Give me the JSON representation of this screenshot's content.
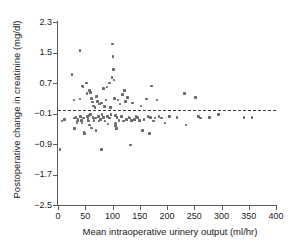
{
  "chart_data": {
    "type": "scatter",
    "title": "",
    "xlabel": "Mean intraoperative urinery output (ml/hr)",
    "ylabel": "Postoperative change in creatinine (mg/dl)",
    "xlim": [
      0,
      400
    ],
    "ylim": [
      -2.5,
      2.3
    ],
    "xticks": [
      0,
      50,
      100,
      150,
      200,
      250,
      300,
      350,
      400
    ],
    "yticks": [
      -2.5,
      -1.7,
      -0.9,
      -0.1,
      0.7,
      1.5,
      2.3
    ],
    "xtick_labels": [
      "0",
      "50",
      "100",
      "150",
      "200",
      "250",
      "300",
      "350",
      "400"
    ],
    "ytick_labels": [
      "-2.5",
      "-1.7",
      "-0.9",
      "-0.1",
      "0.7",
      "1.5",
      "2.3"
    ],
    "grid": false,
    "legend": null,
    "marker_color": "#6b6b6b",
    "reference_line": {
      "orientation": "horizontal",
      "y": 0.0,
      "style": "dashed",
      "color": "#3a3a3a"
    },
    "series": [
      {
        "name": "Patients",
        "points": [
          [
            4,
            -1.05
          ],
          [
            7,
            -0.3
          ],
          [
            12,
            -0.25
          ],
          [
            26,
            0.93
          ],
          [
            29,
            0.25
          ],
          [
            30,
            -0.5
          ],
          [
            30,
            -0.22
          ],
          [
            33,
            -0.2
          ],
          [
            35,
            -0.35
          ],
          [
            36,
            -0.3
          ],
          [
            37,
            -0.25
          ],
          [
            40,
            1.55
          ],
          [
            40,
            0.28
          ],
          [
            41,
            -0.18
          ],
          [
            42,
            -0.3
          ],
          [
            43,
            -0.28
          ],
          [
            44,
            -0.35
          ],
          [
            45,
            0.62
          ],
          [
            46,
            0.6
          ],
          [
            47,
            -0.22
          ],
          [
            48,
            -0.58
          ],
          [
            49,
            -0.62
          ],
          [
            52,
            0.7
          ],
          [
            53,
            0.42
          ],
          [
            54,
            -0.18
          ],
          [
            55,
            -0.25
          ],
          [
            56,
            -0.3
          ],
          [
            57,
            -0.15
          ],
          [
            58,
            0.5
          ],
          [
            58,
            -0.4
          ],
          [
            60,
            0.45
          ],
          [
            60,
            -0.12
          ],
          [
            61,
            0.3
          ],
          [
            62,
            -0.48
          ],
          [
            63,
            0.2
          ],
          [
            64,
            -0.2
          ],
          [
            65,
            0.1
          ],
          [
            66,
            -0.28
          ],
          [
            68,
            0.05
          ],
          [
            69,
            -0.22
          ],
          [
            70,
            -0.55
          ],
          [
            71,
            0.35
          ],
          [
            73,
            0.22
          ],
          [
            74,
            -0.18
          ],
          [
            75,
            -0.3
          ],
          [
            76,
            0.15
          ],
          [
            78,
            -0.25
          ],
          [
            80,
            -1.05
          ],
          [
            80,
            0.18
          ],
          [
            81,
            -0.12
          ],
          [
            83,
            0.55
          ],
          [
            84,
            -0.2
          ],
          [
            85,
            0.08
          ],
          [
            86,
            -0.3
          ],
          [
            88,
            0.25
          ],
          [
            90,
            0.6
          ],
          [
            91,
            -0.18
          ],
          [
            92,
            -0.38
          ],
          [
            94,
            0.7
          ],
          [
            95,
            -0.22
          ],
          [
            96,
            0.05
          ],
          [
            97,
            -0.12
          ],
          [
            99,
            0.85
          ],
          [
            100,
            1.72
          ],
          [
            101,
            1.4
          ],
          [
            102,
            1.05
          ],
          [
            103,
            0.78
          ],
          [
            104,
            0.3
          ],
          [
            105,
            -0.15
          ],
          [
            105,
            -0.42
          ],
          [
            106,
            -0.35
          ],
          [
            107,
            -0.5
          ],
          [
            108,
            -0.2
          ],
          [
            110,
            0.25
          ],
          [
            112,
            -0.28
          ],
          [
            114,
            0.15
          ],
          [
            116,
            -0.18
          ],
          [
            118,
            0.4
          ],
          [
            120,
            -0.3
          ],
          [
            122,
            0.5
          ],
          [
            124,
            0.22
          ],
          [
            126,
            -0.25
          ],
          [
            128,
            0.32
          ],
          [
            130,
            -0.2
          ],
          [
            132,
            -0.22
          ],
          [
            133,
            -0.93
          ],
          [
            135,
            -0.28
          ],
          [
            137,
            0.18
          ],
          [
            140,
            -0.25
          ],
          [
            143,
            -0.18
          ],
          [
            146,
            -0.2
          ],
          [
            150,
            -0.28
          ],
          [
            152,
            0.1
          ],
          [
            155,
            -0.55
          ],
          [
            158,
            -0.25
          ],
          [
            162,
            0.28
          ],
          [
            165,
            -0.18
          ],
          [
            168,
            -0.62
          ],
          [
            170,
            -0.2
          ],
          [
            172,
            0.62
          ],
          [
            175,
            -0.3
          ],
          [
            178,
            -0.22
          ],
          [
            182,
            0.25
          ],
          [
            185,
            -0.18
          ],
          [
            190,
            -0.22
          ],
          [
            196,
            -0.35
          ],
          [
            205,
            -0.18
          ],
          [
            218,
            -0.2
          ],
          [
            232,
            0.42
          ],
          [
            235,
            -0.4
          ],
          [
            252,
            0.32
          ],
          [
            258,
            -0.18
          ],
          [
            262,
            -0.22
          ],
          [
            278,
            -0.2
          ],
          [
            295,
            -0.12
          ],
          [
            341,
            -0.2
          ],
          [
            356,
            -0.2
          ]
        ]
      }
    ]
  }
}
